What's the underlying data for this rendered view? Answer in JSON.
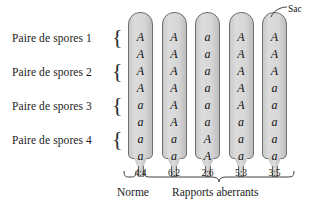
{
  "figure": {
    "sac_callout": "Sac",
    "spore_pair_labels": [
      "Paire de spores 1",
      "Paire de spores 2",
      "Paire de spores 3",
      "Paire de spores 4"
    ],
    "asci": [
      {
        "ratio": "4:4",
        "spores": [
          "A",
          "A",
          "A",
          "A",
          "a",
          "a",
          "a",
          "a"
        ]
      },
      {
        "ratio": "6:2",
        "spores": [
          "A",
          "A",
          "A",
          "A",
          "A",
          "A",
          "a",
          "a"
        ]
      },
      {
        "ratio": "2:6",
        "spores": [
          "a",
          "a",
          "a",
          "a",
          "a",
          "a",
          "A",
          "A"
        ]
      },
      {
        "ratio": "5:3",
        "spores": [
          "A",
          "A",
          "A",
          "A",
          "A",
          "a",
          "a",
          "a"
        ]
      },
      {
        "ratio": "3:5",
        "spores": [
          "A",
          "A",
          "A",
          "a",
          "a",
          "a",
          "a",
          "a"
        ]
      }
    ],
    "group_labels": {
      "normal": "Norme",
      "aberrant": "Rapports aberrants"
    },
    "colors": {
      "tube_fill": "#d6d6d6",
      "tube_outline": "#6d6d6d",
      "text": "#1a1a1a",
      "background": "#ffffff"
    }
  }
}
